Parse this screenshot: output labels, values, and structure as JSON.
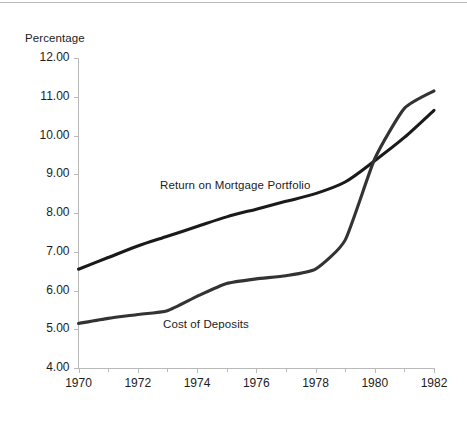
{
  "chart_data": {
    "type": "line",
    "title": "",
    "subtitle": "",
    "xlabel": "",
    "ylabel": "Percentage",
    "xlim": [
      1970,
      1982
    ],
    "ylim": [
      4.0,
      12.0
    ],
    "grid": false,
    "legend_position": "inline-annotations",
    "y_tick_labels": [
      "12.00",
      "11.00",
      "10.00",
      "9.00",
      "8.00",
      "7.00",
      "6.00",
      "5.00",
      "4.00"
    ],
    "y_tick_values": [
      12.0,
      11.0,
      10.0,
      9.0,
      8.0,
      7.0,
      6.0,
      5.0,
      4.0
    ],
    "x_tick_labels": [
      "1970",
      "1972",
      "1974",
      "1976",
      "1978",
      "1980",
      "1982"
    ],
    "x_tick_values": [
      1970,
      1972,
      1974,
      1976,
      1978,
      1980,
      1982
    ],
    "x_minor_tick_values": [
      1971,
      1973,
      1975,
      1977,
      1979,
      1981
    ],
    "x": [
      1970,
      1971,
      1972,
      1973,
      1974,
      1975,
      1976,
      1977,
      1978,
      1979,
      1980,
      1981,
      1982
    ],
    "series": [
      {
        "name": "Return on Mortgage Portfolio",
        "color": "#1a1a1a",
        "values": [
          6.55,
          6.85,
          7.15,
          7.4,
          7.65,
          7.9,
          8.1,
          8.3,
          8.5,
          8.8,
          9.35,
          9.95,
          10.65
        ]
      },
      {
        "name": "Cost of Deposits",
        "color": "#333333",
        "values": [
          5.15,
          5.28,
          5.38,
          5.48,
          5.85,
          6.18,
          6.3,
          6.38,
          6.55,
          7.3,
          9.4,
          10.7,
          11.15
        ]
      }
    ],
    "annotations": [
      {
        "text": "Return on Mortgage Portfolio",
        "x": 1973.2,
        "y": 8.92
      },
      {
        "text": "Cost of Deposits",
        "x": 1973.3,
        "y": 5.1
      }
    ],
    "axis_color": "#b9b9b9",
    "text_color": "#1c1c1c"
  }
}
